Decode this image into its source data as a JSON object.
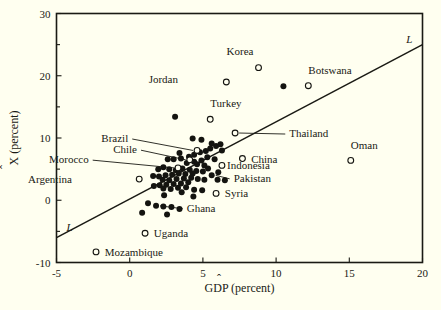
{
  "figure": {
    "background_color": "#fffff0",
    "ink_color": "#1a1a14"
  },
  "chart_data": {
    "type": "scatter",
    "title": "",
    "xlabel": "GDP (percent)",
    "xlabel_parts": {
      "pre": "G",
      "hat_letter": "D",
      "post": "P (percent)"
    },
    "ylabel": "X (percent)",
    "ylabel_parts": {
      "hat_letter": "X",
      "post": " (percent)"
    },
    "xlim": [
      -5,
      20
    ],
    "ylim": [
      -10,
      30
    ],
    "xticks": [
      -5,
      0,
      5,
      10,
      15,
      20
    ],
    "xtick_labels": [
      "-5",
      "0",
      "5",
      "10",
      "15",
      "20"
    ],
    "yticks": [
      -10,
      0,
      10,
      20,
      30
    ],
    "ytick_labels": [
      "-10",
      "0",
      "10",
      "20",
      "30"
    ],
    "yminorticks": [
      -5,
      5,
      15,
      25
    ],
    "grid": false,
    "legend": false,
    "fit_line": {
      "label": "L",
      "label_positions": [
        "left-lower",
        "right-upper"
      ],
      "x_start": -5,
      "y_start": -6.0,
      "x_end": 20,
      "y_end": 25.0,
      "slope": 1.24,
      "intercept": 0.2
    },
    "marker_styles": {
      "filled": "solid black circle (unlabeled country)",
      "open": "open circle (labeled country)"
    },
    "labeled_points": [
      {
        "name": "Korea",
        "x": 8.8,
        "y": 21.3,
        "marker": "open",
        "label_dx": -0.35,
        "label_dy": 2.6,
        "leader": false
      },
      {
        "name": "Botswana",
        "x": 12.2,
        "y": 18.4,
        "marker": "open",
        "label_dx": 0.0,
        "label_dy": 2.6,
        "leader": false
      },
      {
        "name": "Jordan",
        "x": 6.6,
        "y": 19.0,
        "marker": "open",
        "label_dx": -3.3,
        "label_dy": 0.45,
        "leader": false
      },
      {
        "name": "Turkey",
        "x": 5.5,
        "y": 13.0,
        "marker": "open",
        "label_dx": 0.0,
        "label_dy": 2.6,
        "leader": false
      },
      {
        "name": "Thailand",
        "x": 7.2,
        "y": 10.8,
        "marker": "open",
        "label_dx": 3.7,
        "label_dy": 0.0,
        "leader": true
      },
      {
        "name": "Brazil",
        "x": 4.6,
        "y": 8.0,
        "marker": "open",
        "label_dx": -4.7,
        "label_dy": 2.0,
        "leader": true
      },
      {
        "name": "Chile",
        "x": 4.1,
        "y": 6.5,
        "marker": "open",
        "label_dx": -3.6,
        "label_dy": 1.7,
        "leader": true
      },
      {
        "name": "China",
        "x": 7.7,
        "y": 6.7,
        "marker": "open",
        "label_dx": 0.6,
        "label_dy": 0.0,
        "leader": false
      },
      {
        "name": "Oman",
        "x": 15.1,
        "y": 6.4,
        "marker": "open",
        "label_dx": 0.0,
        "label_dy": 2.4,
        "leader": false
      },
      {
        "name": "Morocco",
        "x": 3.3,
        "y": 5.2,
        "marker": "open",
        "label_dx": -6.1,
        "label_dy": 1.4,
        "leader": true
      },
      {
        "name": "Indonesia",
        "x": 6.3,
        "y": 5.6,
        "marker": "open",
        "label_dx": 0.35,
        "label_dy": 0.0,
        "leader": false
      },
      {
        "name": "Pakistan",
        "x": 5.6,
        "y": 4.0,
        "marker": "filled",
        "label_dx": 1.5,
        "label_dy": -0.4,
        "leader": true
      },
      {
        "name": "Argentina",
        "x": 0.65,
        "y": 3.4,
        "marker": "open",
        "label_dx": -4.6,
        "label_dy": 0.0,
        "leader": false
      },
      {
        "name": "Syria",
        "x": 5.9,
        "y": 1.1,
        "marker": "open",
        "label_dx": 0.6,
        "label_dy": 0.0,
        "leader": false
      },
      {
        "name": "Ghana",
        "x": 1.8,
        "y": -0.9,
        "marker": "filled",
        "label_dx": 2.1,
        "label_dy": -0.3,
        "leader": true
      },
      {
        "name": "Uganda",
        "x": 1.05,
        "y": -5.3,
        "marker": "open",
        "label_dx": 0.6,
        "label_dy": 0.0,
        "leader": false
      },
      {
        "name": "Mozambique",
        "x": -2.3,
        "y": -8.3,
        "marker": "open",
        "label_dx": 0.6,
        "label_dy": 0.0,
        "leader": false
      }
    ],
    "unlabeled_points": [
      {
        "x": 10.5,
        "y": 18.3
      },
      {
        "x": 3.1,
        "y": 13.4
      },
      {
        "x": 4.3,
        "y": 9.9
      },
      {
        "x": 4.9,
        "y": 9.7
      },
      {
        "x": 5.6,
        "y": 9.1
      },
      {
        "x": 5.9,
        "y": 8.7
      },
      {
        "x": 6.2,
        "y": 9.0
      },
      {
        "x": 6.3,
        "y": 8.0
      },
      {
        "x": 5.5,
        "y": 8.3
      },
      {
        "x": 5.2,
        "y": 7.9
      },
      {
        "x": 4.8,
        "y": 7.7
      },
      {
        "x": 4.4,
        "y": 7.3
      },
      {
        "x": 4.05,
        "y": 7.0
      },
      {
        "x": 3.5,
        "y": 6.7
      },
      {
        "x": 3.0,
        "y": 6.6
      },
      {
        "x": 2.6,
        "y": 6.6
      },
      {
        "x": 5.3,
        "y": 6.9
      },
      {
        "x": 5.8,
        "y": 6.6
      },
      {
        "x": 4.9,
        "y": 6.4
      },
      {
        "x": 4.4,
        "y": 6.2
      },
      {
        "x": 3.9,
        "y": 6.0
      },
      {
        "x": 4.6,
        "y": 5.8
      },
      {
        "x": 5.1,
        "y": 5.6
      },
      {
        "x": 2.3,
        "y": 5.3
      },
      {
        "x": 1.95,
        "y": 5.0
      },
      {
        "x": 2.7,
        "y": 5.0
      },
      {
        "x": 3.15,
        "y": 4.8
      },
      {
        "x": 3.6,
        "y": 5.1
      },
      {
        "x": 4.1,
        "y": 4.9
      },
      {
        "x": 4.55,
        "y": 4.7
      },
      {
        "x": 5.0,
        "y": 4.6
      },
      {
        "x": 4.3,
        "y": 4.3
      },
      {
        "x": 3.8,
        "y": 4.2
      },
      {
        "x": 3.35,
        "y": 4.3
      },
      {
        "x": 2.9,
        "y": 4.1
      },
      {
        "x": 2.45,
        "y": 4.0
      },
      {
        "x": 2.0,
        "y": 3.8
      },
      {
        "x": 1.6,
        "y": 3.9
      },
      {
        "x": 2.25,
        "y": 3.3
      },
      {
        "x": 2.7,
        "y": 3.2
      },
      {
        "x": 3.2,
        "y": 3.4
      },
      {
        "x": 3.7,
        "y": 3.5
      },
      {
        "x": 4.2,
        "y": 3.6
      },
      {
        "x": 4.65,
        "y": 3.4
      },
      {
        "x": 5.1,
        "y": 3.3
      },
      {
        "x": 6.0,
        "y": 3.3
      },
      {
        "x": 6.5,
        "y": 3.2
      },
      {
        "x": 4.0,
        "y": 2.9
      },
      {
        "x": 3.5,
        "y": 2.7
      },
      {
        "x": 3.0,
        "y": 2.6
      },
      {
        "x": 2.5,
        "y": 2.5
      },
      {
        "x": 2.05,
        "y": 2.4
      },
      {
        "x": 1.65,
        "y": 2.3
      },
      {
        "x": 2.3,
        "y": 1.9
      },
      {
        "x": 2.8,
        "y": 1.8
      },
      {
        "x": 3.3,
        "y": 2.0
      },
      {
        "x": 3.85,
        "y": 2.1
      },
      {
        "x": 4.4,
        "y": 1.7
      },
      {
        "x": 4.95,
        "y": 1.6
      },
      {
        "x": 3.55,
        "y": 1.3
      },
      {
        "x": 4.35,
        "y": 0.6
      },
      {
        "x": 2.35,
        "y": 0.8
      },
      {
        "x": 1.25,
        "y": -0.5
      },
      {
        "x": 2.3,
        "y": -1.0
      },
      {
        "x": 2.85,
        "y": -1.1
      },
      {
        "x": 3.4,
        "y": -1.4
      },
      {
        "x": 0.85,
        "y": -2.0
      },
      {
        "x": 2.55,
        "y": -2.3
      },
      {
        "x": 3.4,
        "y": 7.6
      },
      {
        "x": 5.35,
        "y": 5.1
      },
      {
        "x": 6.05,
        "y": 4.5
      }
    ]
  }
}
